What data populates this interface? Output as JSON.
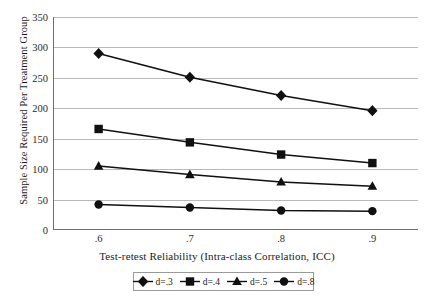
{
  "chart_data": {
    "type": "line",
    "title": "",
    "xlabel": "Test-retest Reliability (Intra-class Correlation, ICC)",
    "ylabel": "Sample Size Required Per Treatment Group",
    "x": [
      0.6,
      0.7,
      0.8,
      0.9
    ],
    "categories": [
      ".6",
      ".7",
      ".8",
      ".9"
    ],
    "xtick_labels": [
      ".6",
      ".7",
      ".8",
      ".9"
    ],
    "ytick_labels": [
      "0",
      "50",
      "100",
      "150",
      "200",
      "250",
      "300",
      "350"
    ],
    "ytick_values": [
      0,
      50,
      100,
      150,
      200,
      250,
      300,
      350
    ],
    "ylim": [
      0,
      350
    ],
    "xlim": [
      0.55,
      0.95
    ],
    "grid": "horizontal",
    "legend_position": "below-axis-centered",
    "series": [
      {
        "name": "d=.3",
        "marker": "diamond",
        "color": "#101010",
        "values": [
          290,
          251,
          221,
          196
        ]
      },
      {
        "name": "d=.4",
        "marker": "square",
        "color": "#101010",
        "values": [
          166,
          144,
          124,
          110
        ]
      },
      {
        "name": "d=.5",
        "marker": "triangle",
        "color": "#101010",
        "values": [
          105,
          91,
          79,
          72
        ]
      },
      {
        "name": "d=.8",
        "marker": "circle",
        "color": "#101010",
        "values": [
          42,
          37,
          32,
          31
        ]
      }
    ]
  },
  "axes": {
    "y_title": "Sample Size Required Per Treatment Group",
    "x_title": "Test-retest Reliability (Intra-class Correlation, ICC)"
  },
  "legend": {
    "entries": [
      {
        "label": "d=.3",
        "marker": "diamond-marker-icon"
      },
      {
        "label": "d=.4",
        "marker": "square-marker-icon"
      },
      {
        "label": "d=.5",
        "marker": "triangle-marker-icon"
      },
      {
        "label": "d=.8",
        "marker": "circle-marker-icon"
      }
    ]
  },
  "colors": {
    "series_ink": "#101010",
    "gridline": "#b9b9b9",
    "axis": "#6e6e6e",
    "text": "#1a1a1a",
    "background": "#ffffff"
  },
  "caption": {
    "partial_text": ""
  }
}
